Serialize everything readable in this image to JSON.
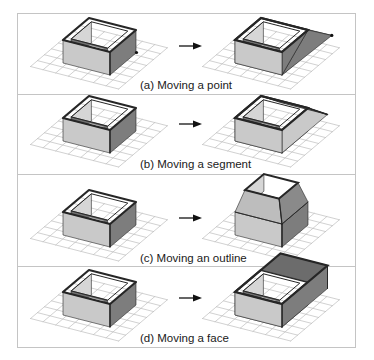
{
  "figure": {
    "panels": [
      {
        "id": "a",
        "caption": "(a) Moving a point",
        "operation": "point"
      },
      {
        "id": "b",
        "caption": "(b) Moving a segment",
        "operation": "segment"
      },
      {
        "id": "c",
        "caption": "(c) Moving an outline",
        "operation": "outline"
      },
      {
        "id": "d",
        "caption": "(d) Moving a face",
        "operation": "face"
      }
    ],
    "arrow_icon": "right-arrow-icon"
  },
  "colors": {
    "frame": "#c4c4c4",
    "grid": "#bdbdbd",
    "face_light": "#c9c9c9",
    "face_dark": "#7d7d7d",
    "inner_dark": "#6f6f6f",
    "inner_light": "#d6d6d6",
    "edge": "#262626",
    "opening": "#ffffff",
    "point": "#111111"
  }
}
